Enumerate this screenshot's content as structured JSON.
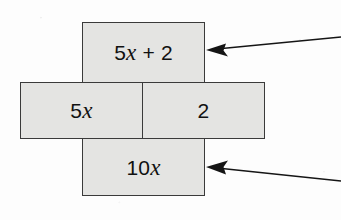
{
  "figure": {
    "type": "algebra-tile-area-model",
    "background_color": "#fdfdfd",
    "cell_fill_color": "#e4e4e2",
    "cell_border_color": "#3a3a3a",
    "text_color": "#111111",
    "arrow_color": "#151515"
  },
  "cells": {
    "top": {
      "name": "top-box",
      "text": "5x + 2",
      "parts": [
        {
          "text": "5",
          "italic": false
        },
        {
          "text": "x",
          "italic": true
        },
        {
          "text": " + 2",
          "italic": false
        }
      ]
    },
    "middle_left": {
      "name": "middle-left-box",
      "text": "5x",
      "parts": [
        {
          "text": "5",
          "italic": false
        },
        {
          "text": "x",
          "italic": true
        }
      ]
    },
    "middle_right": {
      "name": "middle-right-box",
      "text": "2",
      "parts": [
        {
          "text": "2",
          "italic": false
        }
      ]
    },
    "bottom": {
      "name": "bottom-box",
      "text": "10x",
      "parts": [
        {
          "text": "10",
          "italic": false
        },
        {
          "text": "x",
          "italic": true
        }
      ]
    }
  },
  "arrows": [
    {
      "name": "arrow-to-top-box",
      "direction": "left",
      "tip": {
        "x": 206,
        "y": 50
      },
      "tail": {
        "x": 341,
        "y": 37
      }
    },
    {
      "name": "arrow-to-bottom-box",
      "direction": "left",
      "tip": {
        "x": 206,
        "y": 167
      },
      "tail": {
        "x": 341,
        "y": 181
      }
    }
  ]
}
